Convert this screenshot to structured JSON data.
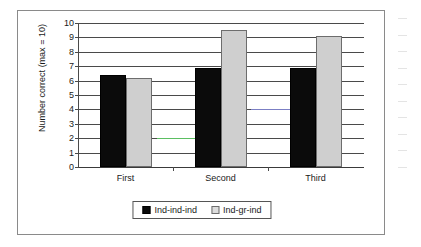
{
  "chart_data": {
    "type": "bar",
    "title": "",
    "subtitle": "",
    "xlabel": "",
    "ylabel": "Number correct (max = 10)",
    "categories": [
      "First",
      "Second",
      "Third"
    ],
    "series": [
      {
        "name": "Ind-ind-ind",
        "color": "#0b0b0b",
        "values": [
          6.4,
          6.9,
          6.9
        ]
      },
      {
        "name": "Ind-gr-ind",
        "color": "#cfcfcf",
        "values": [
          6.2,
          9.5,
          9.1
        ]
      }
    ],
    "ylim": [
      0,
      10
    ],
    "yticks": [
      0,
      1,
      2,
      3,
      4,
      5,
      6,
      7,
      8,
      9,
      10
    ],
    "ytick_labels": [
      "0",
      "1",
      "2",
      "3",
      "4",
      "5",
      "6",
      "7",
      "8",
      "9",
      "10"
    ],
    "grid": true,
    "grid_axis": "y",
    "legend_position": "bottom"
  },
  "figure": {
    "border_color": "#8a8a8a",
    "background": "#ffffff",
    "axis_color": "#4a4a4a"
  },
  "artifacts": [
    {
      "name": "green-gridline-segment",
      "value": 2,
      "color": "#5bbf62"
    },
    {
      "name": "blue-gridline-segment",
      "value": 4,
      "color": "#7b7fc4"
    }
  ]
}
